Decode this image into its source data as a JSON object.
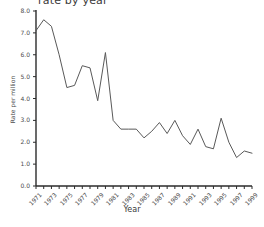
{
  "chart_data": {
    "type": "line",
    "title": "",
    "title_clipped": "rate by year",
    "xlabel": "Year",
    "ylabel": "Rate per million",
    "grid": false,
    "legend": null,
    "ylim": [
      0.0,
      8.0
    ],
    "ytick_labels": [
      "0.0",
      "1.0",
      "2.0",
      "3.0",
      "4.0",
      "5.0",
      "6.0",
      "7.0",
      "8.0"
    ],
    "ytick_values": [
      0.0,
      1.0,
      2.0,
      3.0,
      4.0,
      5.0,
      6.0,
      7.0,
      8.0
    ],
    "xlim": [
      1971,
      1999
    ],
    "xtick_labels": [
      "1971",
      "1973",
      "1975",
      "1977",
      "1979",
      "1981",
      "1983",
      "1985",
      "1987",
      "1989",
      "1991",
      "1993",
      "1995",
      "1997",
      "1999"
    ],
    "x": [
      1971,
      1972,
      1973,
      1974,
      1975,
      1976,
      1977,
      1978,
      1979,
      1980,
      1981,
      1982,
      1983,
      1984,
      1985,
      1986,
      1987,
      1988,
      1989,
      1990,
      1991,
      1992,
      1993,
      1994,
      1995,
      1996,
      1997,
      1998,
      1999
    ],
    "series": [
      {
        "name": "Rate per million",
        "color": "#595959",
        "values": [
          7.1,
          7.6,
          7.3,
          6.0,
          4.5,
          4.6,
          5.5,
          5.4,
          3.9,
          6.1,
          3.0,
          2.6,
          2.6,
          2.6,
          2.2,
          2.5,
          2.9,
          2.4,
          3.0,
          2.3,
          1.9,
          2.6,
          1.8,
          1.7,
          3.1,
          2.0,
          1.3,
          1.6,
          1.5
        ]
      }
    ],
    "annotations": []
  },
  "style": {
    "background": "#ffffff",
    "line_color": "#595959",
    "axis_color": "#2b2b2b",
    "text_color": "#4a4a4a"
  }
}
